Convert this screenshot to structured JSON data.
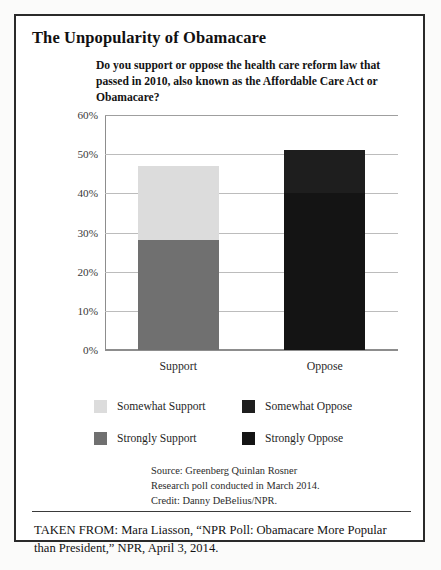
{
  "headline": "The Unpopularity of Obamacare",
  "question": "Do you support or oppose the health care reform law that passed in 2010, also known as the Affordable Care Act or Obamacare?",
  "legend": {
    "items": [
      {
        "label": "Somewhat Support",
        "color": "#dcdcdc"
      },
      {
        "label": "Somewhat Oppose",
        "color": "#1e1e1e"
      },
      {
        "label": "Strongly Support",
        "color": "#707070"
      },
      {
        "label": "Strongly Oppose",
        "color": "#141414"
      }
    ]
  },
  "source": {
    "line1": "Source: Greenberg Quinlan Rosner",
    "line2": "Research poll conducted in March 2014.",
    "line3": "Credit: Danny DeBelius/NPR."
  },
  "taken_from": "TAKEN FROM: Mara Liasson, “NPR Poll: Obamacare More Popular than President,” NPR, April 3, 2014.",
  "chart_data": {
    "type": "bar",
    "subtype": "stacked-column",
    "title": "Do you support or oppose the health care reform law that passed in 2010, also known as the Affordable Care Act or Obamacare?",
    "xlabel": "",
    "ylabel": "",
    "ylim": [
      0,
      60
    ],
    "ytick_values": [
      0,
      10,
      20,
      30,
      40,
      50,
      60
    ],
    "ytick_labels": [
      "0%",
      "10%",
      "20%",
      "30%",
      "40%",
      "50%",
      "60%"
    ],
    "grid": true,
    "grid_axis": "y",
    "legend_position": "bottom",
    "categories": [
      "Support",
      "Oppose"
    ],
    "series": [
      {
        "name": "Strongly Support",
        "color": "#707070",
        "values": [
          28,
          0
        ]
      },
      {
        "name": "Somewhat Support",
        "color": "#dcdcdc",
        "values": [
          19,
          0
        ]
      },
      {
        "name": "Strongly Oppose",
        "color": "#141414",
        "values": [
          0,
          40
        ]
      },
      {
        "name": "Somewhat Oppose",
        "color": "#1e1e1e",
        "values": [
          0,
          11
        ]
      }
    ],
    "totals": [
      47,
      51
    ]
  }
}
